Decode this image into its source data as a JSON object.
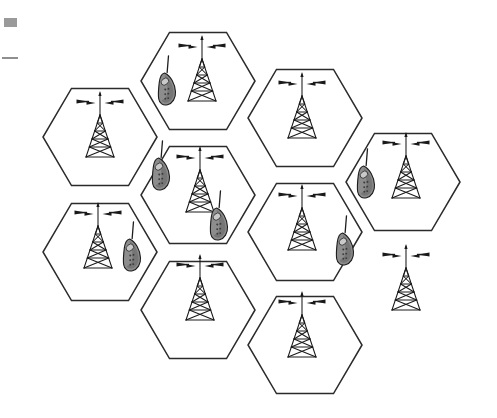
{
  "figure": {
    "background_color": "#ffffff",
    "cell_outline_color": "#2b2b2b",
    "tower_color": "#1a1a1a",
    "phone_fill_color": "#8d8d8d",
    "phone_outline_color": "#1d1d1d",
    "cell_count": 9,
    "tower_count": 9,
    "phone_count": 6
  },
  "geometry": {
    "hex_radius": 57,
    "orientation": "flat-top",
    "canvas": {
      "width": 497,
      "height": 418
    }
  },
  "cells": [
    {
      "id": "cell-1",
      "label": "Cell 1",
      "cx": 100,
      "cy": 137,
      "tower": {
        "name": "base-station-1",
        "cx": 100,
        "cy": 137
      }
    },
    {
      "id": "cell-2",
      "label": "Cell 2",
      "cx": 198,
      "cy": 81,
      "tower": {
        "name": "base-station-2",
        "cx": 202,
        "cy": 81
      }
    },
    {
      "id": "cell-3",
      "label": "Cell 3",
      "cx": 305,
      "cy": 118,
      "tower": {
        "name": "base-station-3",
        "cx": 302,
        "cy": 118
      }
    },
    {
      "id": "cell-4",
      "label": "Cell 4",
      "cx": 403,
      "cy": 182,
      "tower": {
        "name": "base-station-4",
        "cx": 406,
        "cy": 178
      }
    },
    {
      "id": "cell-5",
      "label": "Cell 5",
      "cx": 198,
      "cy": 195,
      "tower": {
        "name": "base-station-5",
        "cx": 200,
        "cy": 192
      }
    },
    {
      "id": "cell-6",
      "label": "Cell 6",
      "cx": 305,
      "cy": 232,
      "tower": {
        "name": "base-station-6",
        "cx": 302,
        "cy": 230
      }
    },
    {
      "id": "cell-7",
      "label": "Cell 7",
      "cx": 100,
      "cy": 252,
      "tower": {
        "name": "base-station-7",
        "cx": 98,
        "cy": 248
      }
    },
    {
      "id": "cell-8",
      "label": "Cell 8",
      "cx": 198,
      "cy": 310,
      "tower": {
        "name": "base-station-8",
        "cx": 200,
        "cy": 300
      }
    },
    {
      "id": "cell-9",
      "label": "Cell 9",
      "cx": 305,
      "cy": 345,
      "tower": {
        "name": "base-station-9",
        "cx": 302,
        "cy": 337
      }
    }
  ],
  "extra_towers": [
    {
      "id": "tower-right-lower",
      "name": "base-station-10",
      "cx": 406,
      "cy": 290
    }
  ],
  "phones": [
    {
      "id": "phone-1",
      "label": "Mobile handset 1",
      "cx": 166,
      "cy": 87,
      "rotate": -22
    },
    {
      "id": "phone-2",
      "label": "Mobile handset 2",
      "cx": 160,
      "cy": 172,
      "rotate": -22
    },
    {
      "id": "phone-3",
      "label": "Mobile handset 3",
      "cx": 218,
      "cy": 222,
      "rotate": -22
    },
    {
      "id": "phone-4",
      "label": "Mobile handset 4",
      "cx": 131,
      "cy": 253,
      "rotate": -22
    },
    {
      "id": "phone-5",
      "label": "Mobile handset 5",
      "cx": 365,
      "cy": 180,
      "rotate": -22
    },
    {
      "id": "phone-6",
      "label": "Mobile handset 6",
      "cx": 344,
      "cy": 247,
      "rotate": -22
    }
  ],
  "scan_artifacts": [
    {
      "id": "scan-mark-block",
      "name": "scan-artifact-block",
      "color": "#9a9a9a"
    },
    {
      "id": "scan-mark-line",
      "name": "scan-artifact-line",
      "color": "#8f8f8f"
    }
  ]
}
